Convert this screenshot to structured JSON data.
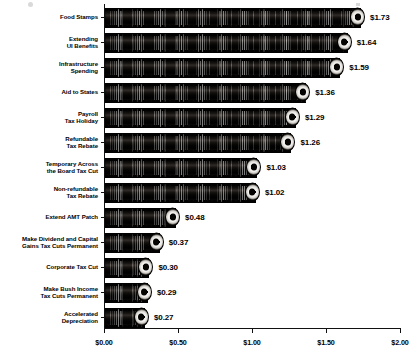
{
  "chart_data": {
    "type": "bar",
    "orientation": "horizontal",
    "title": "",
    "subtitle": "",
    "xlabel": "",
    "ylabel": "",
    "xlim": [
      0,
      2
    ],
    "xticks": [
      "$0.00",
      "$0.50",
      "$1.00",
      "$1.50",
      "$2.00"
    ],
    "xtick_values": [
      0,
      0.5,
      1.0,
      1.5,
      2.0
    ],
    "grid": false,
    "legend": "none",
    "value_label_format": "$0.00",
    "categories": [
      "Food Stamps",
      "Extending UI Benefits",
      "Infrastructure Spending",
      "Aid to States",
      "Payroll Tax Holiday",
      "Refundable Tax Rebate",
      "Temporary Across the Board Tax Cut",
      "Non-refundable Tax Rebate",
      "Extend AMT Patch",
      "Make Dividend and Capital Gains Tax Cuts Permanent",
      "Corporate Tax Cut",
      "Make Bush Income Tax Cuts Permanent",
      "Accelerated Depreciation"
    ],
    "values": [
      1.73,
      1.64,
      1.59,
      1.36,
      1.29,
      1.26,
      1.03,
      1.02,
      0.48,
      0.37,
      0.3,
      0.29,
      0.27
    ],
    "value_labels": [
      "$1.73",
      "$1.64",
      "$1.59",
      "$1.36",
      "$1.29",
      "$1.26",
      "$1.03",
      "$1.02",
      "$0.48",
      "$0.37",
      "$0.30",
      "$0.29",
      "$0.27"
    ]
  },
  "rows": [
    {
      "line1": "Food Stamps",
      "line2": "",
      "value": 1.73,
      "label": "$1.73"
    },
    {
      "line1": "Extending",
      "line2": "UI Benefits",
      "value": 1.64,
      "label": "$1.64"
    },
    {
      "line1": "Infrastructure",
      "line2": "Spending",
      "value": 1.59,
      "label": "$1.59"
    },
    {
      "line1": "Aid to States",
      "line2": "",
      "value": 1.36,
      "label": "$1.36"
    },
    {
      "line1": "Payroll",
      "line2": "Tax Holiday",
      "value": 1.29,
      "label": "$1.29"
    },
    {
      "line1": "Refundable",
      "line2": "Tax Rebate",
      "value": 1.26,
      "label": "$1.26"
    },
    {
      "line1": "Temporary Across",
      "line2": "the Board Tax Cut",
      "value": 1.03,
      "label": "$1.03"
    },
    {
      "line1": "Non-refundable",
      "line2": "Tax Rebate",
      "value": 1.02,
      "label": "$1.02"
    },
    {
      "line1": "Extend AMT Patch",
      "line2": "",
      "value": 0.48,
      "label": "$0.48"
    },
    {
      "line1": "Make Dividend and Capital",
      "line2": "Gains Tax Cuts Permanent",
      "value": 0.37,
      "label": "$0.37"
    },
    {
      "line1": "Corporate Tax Cut",
      "line2": "",
      "value": 0.3,
      "label": "$0.30"
    },
    {
      "line1": "Make Bush Income",
      "line2": "Tax Cuts Permanent",
      "value": 0.29,
      "label": "$0.29"
    },
    {
      "line1": "Accelerated",
      "line2": "Depreciation",
      "value": 0.27,
      "label": "$0.27"
    }
  ],
  "axis": {
    "ticks": [
      {
        "label": "$0.00",
        "value": 0
      },
      {
        "label": "$0.50",
        "value": 0.5
      },
      {
        "label": "$1.00",
        "value": 1.0
      },
      {
        "label": "$1.50",
        "value": 1.5
      },
      {
        "label": "$2.00",
        "value": 2.0
      }
    ]
  },
  "colors": {
    "bar": "#120f0d",
    "axis": "#111111",
    "text": "#000000",
    "background": "#ffffff"
  }
}
